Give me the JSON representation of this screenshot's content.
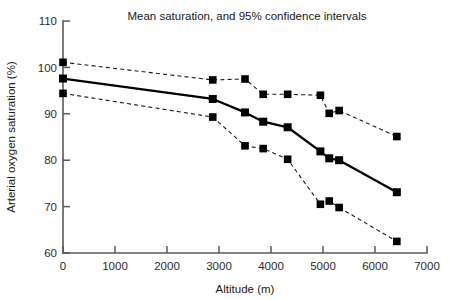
{
  "chart_data": {
    "type": "line",
    "title": "Mean saturation, and 95% confidence intervals",
    "xlabel": "Altitude (m)",
    "ylabel": "Arterial oxygen saturation (%)",
    "xlim": [
      0,
      7000
    ],
    "ylim": [
      60,
      110
    ],
    "xticks": [
      0,
      1000,
      2000,
      3000,
      4000,
      5000,
      6000,
      7000
    ],
    "yticks": [
      60,
      70,
      80,
      90,
      100,
      110
    ],
    "xticklabels": [
      "0",
      "1000",
      "2000",
      "3000",
      "4000",
      "5000",
      "6000",
      "7000"
    ],
    "yticklabels": [
      "60",
      "70",
      "80",
      "90",
      "100",
      "110"
    ],
    "grid": false,
    "legend": "none",
    "marker": "square",
    "series": [
      {
        "name": "Upper 95% confidence interval",
        "style": "dashed",
        "color": "#1a1a1a",
        "x": [
          0,
          2880,
          3500,
          3850,
          4320,
          4950,
          5120,
          5310,
          6420
        ],
        "y": [
          101.1,
          97.3,
          97.5,
          94.2,
          94.2,
          94.0,
          90.1,
          90.7,
          85.1
        ]
      },
      {
        "name": "Mean saturation",
        "style": "solid",
        "color": "#000000",
        "x": [
          0,
          2880,
          3500,
          3850,
          4320,
          4950,
          5120,
          5310,
          6420
        ],
        "y": [
          97.6,
          93.2,
          90.3,
          88.3,
          87.1,
          81.9,
          80.4,
          80.0,
          73.1
        ]
      },
      {
        "name": "Lower 95% confidence interval",
        "style": "dashed",
        "color": "#1a1a1a",
        "x": [
          0,
          2880,
          3500,
          3850,
          4320,
          4950,
          5120,
          5310,
          6420
        ],
        "y": [
          94.4,
          89.3,
          83.1,
          82.5,
          80.2,
          70.5,
          71.2,
          69.8,
          62.5
        ]
      }
    ]
  }
}
